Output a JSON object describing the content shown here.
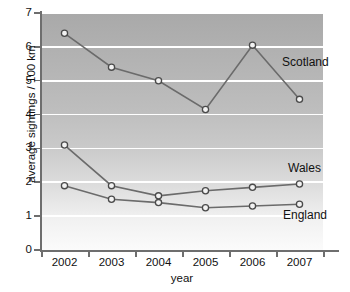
{
  "chart_data": {
    "type": "line",
    "title": "",
    "xlabel": "year",
    "ylabel": "average sightings / 100 km",
    "categories": [
      "2002",
      "2003",
      "2004",
      "2005",
      "2006",
      "2007"
    ],
    "x": [
      2002,
      2003,
      2004,
      2005,
      2006,
      2007
    ],
    "xlim": [
      2001.6,
      2007.4
    ],
    "ylim": [
      0,
      7
    ],
    "y_ticks": [
      "0",
      "1",
      "2",
      "3",
      "4",
      "5",
      "6",
      "7"
    ],
    "grid": "horizontal white gridlines at every integer",
    "legend_position": "inline labels at right end of each series",
    "series": [
      {
        "name": "Scotland",
        "values": [
          6.4,
          5.4,
          5.0,
          4.15,
          6.05,
          4.45
        ]
      },
      {
        "name": "Wales",
        "values": [
          3.1,
          1.9,
          1.6,
          1.75,
          1.85,
          1.95
        ]
      },
      {
        "name": "England",
        "values": [
          1.9,
          1.5,
          1.4,
          1.25,
          1.3,
          1.35
        ]
      }
    ],
    "colors": {
      "line": "#6b6b6b",
      "marker_fill": "#f2f2f2",
      "marker_stroke": "#4a4a4a",
      "plot_bg_top": "#a9a9a9",
      "plot_bg_bottom": "#fbfbfb",
      "gridline": "#ffffff",
      "axis": "#6e6e6e",
      "text": "#111111"
    }
  }
}
